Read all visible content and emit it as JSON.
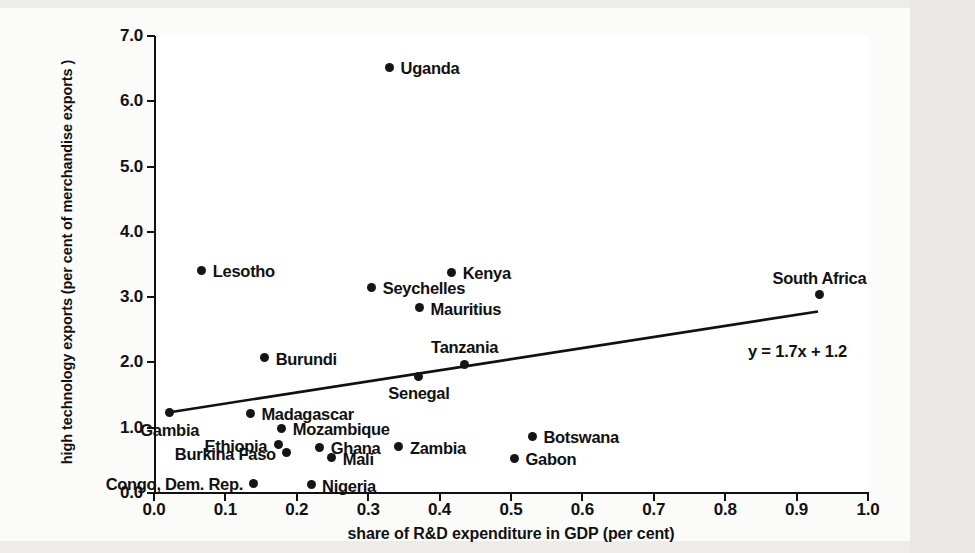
{
  "chart_data": {
    "type": "scatter",
    "title": "",
    "xlabel": "share of R&D  expenditure in GDP (per cent)",
    "ylabel": "high technology exports (per cent of merchandise exports )",
    "xlim": [
      0.0,
      1.0
    ],
    "ylim": [
      0.0,
      7.0
    ],
    "xticks": [
      "0.0",
      "0.1",
      "0.2",
      "0.3",
      "0.4",
      "0.5",
      "0.6",
      "0.7",
      "0.8",
      "0.9",
      "1.0"
    ],
    "yticks": [
      "0.0",
      "1.0",
      "2.0",
      "3.0",
      "4.0",
      "5.0",
      "6.0",
      "7.0"
    ],
    "grid": false,
    "legend": null,
    "trendline": {
      "equation": "y = 1.7x + 1.2",
      "slope": 1.7,
      "intercept": 1.2,
      "x_start": 0.02,
      "x_end": 0.93
    },
    "points": [
      {
        "label": "Uganda",
        "x": 0.33,
        "y": 6.52,
        "label_pos": "right"
      },
      {
        "label": "Lesotho",
        "x": 0.067,
        "y": 3.41,
        "label_pos": "right"
      },
      {
        "label": "Kenya",
        "x": 0.417,
        "y": 3.38,
        "label_pos": "right"
      },
      {
        "label": "Seychelles",
        "x": 0.305,
        "y": 3.15,
        "label_pos": "right"
      },
      {
        "label": "South Africa",
        "x": 0.932,
        "y": 3.04,
        "label_pos": "above"
      },
      {
        "label": "Mauritius",
        "x": 0.372,
        "y": 2.84,
        "label_pos": "right"
      },
      {
        "label": "Burundi",
        "x": 0.155,
        "y": 2.07,
        "label_pos": "right"
      },
      {
        "label": "Tanzania",
        "x": 0.435,
        "y": 1.97,
        "label_pos": "above"
      },
      {
        "label": "Senegal",
        "x": 0.371,
        "y": 1.79,
        "label_pos": "below"
      },
      {
        "label": "Gambia",
        "x": 0.022,
        "y": 1.23,
        "label_pos": "below"
      },
      {
        "label": "Madagascar",
        "x": 0.135,
        "y": 1.22,
        "label_pos": "right"
      },
      {
        "label": "Mozambique",
        "x": 0.179,
        "y": 0.99,
        "label_pos": "right"
      },
      {
        "label": "Botswana",
        "x": 0.53,
        "y": 0.87,
        "label_pos": "right"
      },
      {
        "label": "Ethiopia",
        "x": 0.174,
        "y": 0.74,
        "label_pos": "left"
      },
      {
        "label": "Zambia",
        "x": 0.343,
        "y": 0.71,
        "label_pos": "right"
      },
      {
        "label": "Ghana",
        "x": 0.232,
        "y": 0.7,
        "label_pos": "right"
      },
      {
        "label": "Burkina Faso",
        "x": 0.186,
        "y": 0.62,
        "label_pos": "left"
      },
      {
        "label": "Mali",
        "x": 0.249,
        "y": 0.54,
        "label_pos": "right"
      },
      {
        "label": "Gabon",
        "x": 0.505,
        "y": 0.53,
        "label_pos": "right"
      },
      {
        "label": "Congo, Dem. Rep.",
        "x": 0.14,
        "y": 0.15,
        "label_pos": "left"
      },
      {
        "label": "Nigeria",
        "x": 0.22,
        "y": 0.13,
        "label_pos": "right"
      }
    ]
  },
  "colors": {
    "marker": "#151515",
    "axis": "#111111",
    "plot_background": "#ffffff",
    "page_background": "#eeece9"
  }
}
